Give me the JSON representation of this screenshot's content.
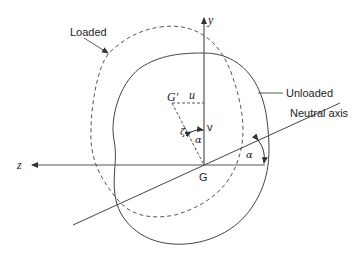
{
  "diagram": {
    "labels": {
      "loaded": "Loaded",
      "unloaded": "Unloaded",
      "neutral_axis": "Neutral axis",
      "y_axis": "y",
      "z_axis": "z",
      "centroid": "G",
      "displaced_centroid": "G′",
      "u": "u",
      "v": "v",
      "zeta": "ζ",
      "alpha_inner": "α",
      "alpha_outer": "α"
    },
    "colors": {
      "stroke": "#444444",
      "background": "#ffffff"
    }
  }
}
